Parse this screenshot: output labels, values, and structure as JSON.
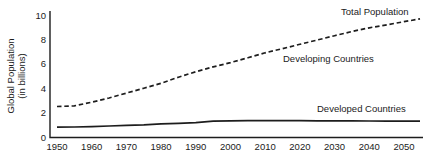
{
  "chart": {
    "y_axis_title_line1": "Global Population",
    "y_axis_title_line2": "(in billions)",
    "labels": {
      "total": "Total Population",
      "developing": "Developing Countries",
      "developed": "Developed Countries"
    },
    "ink_color": "#1d1d1d"
  },
  "chart_data": {
    "type": "line",
    "title": "",
    "xlabel": "",
    "ylabel": "Global Population (in billions)",
    "x": [
      1950,
      1955,
      1960,
      1965,
      1970,
      1975,
      1980,
      1985,
      1990,
      1995,
      2000,
      2005,
      2010,
      2015,
      2020,
      2025,
      2030,
      2035,
      2040,
      2045,
      2050
    ],
    "series": [
      {
        "name": "Total Population",
        "style": "dashed",
        "values": [
          2.5,
          2.55,
          2.85,
          3.2,
          3.6,
          4.0,
          4.4,
          4.9,
          5.35,
          5.75,
          6.1,
          6.5,
          6.9,
          7.25,
          7.6,
          7.95,
          8.3,
          8.65,
          8.95,
          9.2,
          9.45
        ]
      },
      {
        "name": "Developed Countries",
        "style": "solid",
        "values": [
          0.8,
          0.82,
          0.85,
          0.9,
          0.95,
          1.0,
          1.08,
          1.12,
          1.17,
          1.3,
          1.33,
          1.34,
          1.34,
          1.34,
          1.34,
          1.33,
          1.33,
          1.32,
          1.31,
          1.3,
          1.3
        ]
      }
    ],
    "annotations": [
      "Total Population",
      "Developing Countries",
      "Developed Countries"
    ],
    "x_ticks": [
      1950,
      1960,
      1970,
      1980,
      1990,
      2000,
      2010,
      2020,
      2030,
      2040,
      2050
    ],
    "y_ticks": [
      0,
      2,
      4,
      6,
      8,
      10
    ],
    "xlim": [
      1950,
      2050
    ],
    "ylim": [
      0,
      10
    ],
    "grid": false,
    "legend": "inline-annotations"
  }
}
